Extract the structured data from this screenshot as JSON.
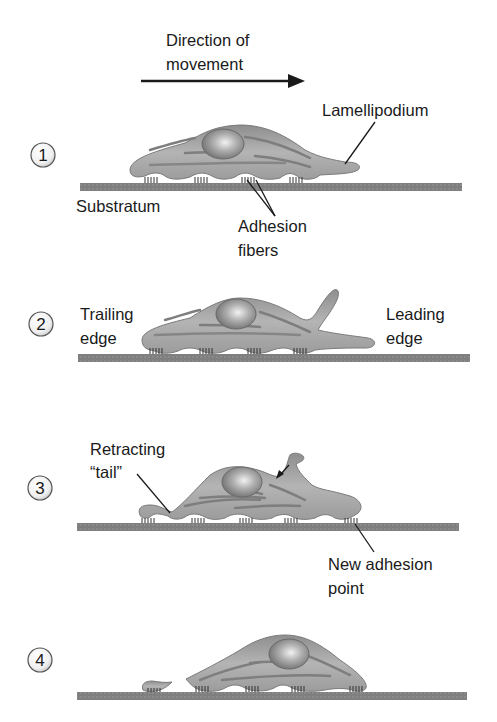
{
  "header": {
    "direction_line1": "Direction of",
    "direction_line2": "movement"
  },
  "colors": {
    "cell_fill": "#9a9a9a",
    "cell_light": "#d4d4d4",
    "cell_stroke": "#7a7a7a",
    "substratum": "#7d7d7d",
    "text": "#1a1a1a",
    "fiber": "#3a3a3a"
  },
  "steps": [
    {
      "number": "1",
      "labels": {
        "lamellipodium": "Lamellipodium",
        "substratum": "Substratum",
        "adhesion_line1": "Adhesion",
        "adhesion_line2": "fibers"
      }
    },
    {
      "number": "2",
      "labels": {
        "trailing_line1": "Trailing",
        "trailing_line2": "edge",
        "leading_line1": "Leading",
        "leading_line2": "edge"
      }
    },
    {
      "number": "3",
      "labels": {
        "retracting_line1": "Retracting",
        "retracting_line2": "“tail”",
        "new_adhesion_line1": "New adhesion",
        "new_adhesion_line2": "point"
      }
    },
    {
      "number": "4",
      "labels": {}
    }
  ]
}
